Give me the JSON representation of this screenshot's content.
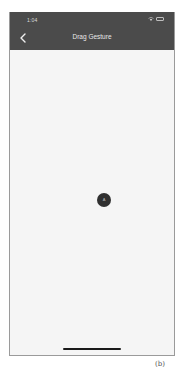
{
  "status_bar": {
    "time": "1:04",
    "icons": [
      "wifi-icon",
      "battery-icon"
    ]
  },
  "nav_bar": {
    "title": "Drag Gesture",
    "back_icon": "chevron-left-icon"
  },
  "content": {
    "drag_circle": {
      "label": "A",
      "color": "#303030"
    }
  },
  "caption": "(b)",
  "colors": {
    "header": "#4b4b4b",
    "background": "#f5f5f5",
    "title_text": "#e8e8e8"
  }
}
